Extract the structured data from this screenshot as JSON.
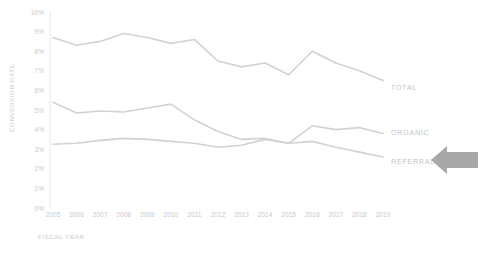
{
  "chart_data": {
    "type": "line",
    "title": "",
    "xlabel": "FISCAL YEAR",
    "ylabel": "CONVERSION RATE",
    "x": [
      2005,
      2006,
      2007,
      2008,
      2009,
      2010,
      2011,
      2012,
      2013,
      2014,
      2015,
      2016,
      2017,
      2018,
      2019
    ],
    "categories": [
      "2005",
      "2006",
      "2007",
      "2008",
      "2009",
      "2010",
      "2011",
      "2012",
      "2013",
      "2014",
      "2015",
      "2016",
      "2017",
      "2018",
      "2019"
    ],
    "ytick_labels": [
      "0%",
      "1%",
      "2%",
      "3%",
      "4%",
      "5%",
      "6%",
      "7%",
      "8%",
      "9%",
      "10%"
    ],
    "ytick_values": [
      0,
      1,
      2,
      3,
      4,
      5,
      6,
      7,
      8,
      9,
      10
    ],
    "ylim": [
      0,
      10
    ],
    "xlim": [
      2005,
      2019
    ],
    "grid": false,
    "legend_position": "right-inline",
    "units": "percent",
    "series": [
      {
        "name": "TOTAL",
        "label": "TOTAL",
        "color": "#d2d2d2",
        "values": [
          8.7,
          8.3,
          8.5,
          8.9,
          8.7,
          8.4,
          8.6,
          7.5,
          7.2,
          7.4,
          6.8,
          8.0,
          7.4,
          7.0,
          6.5
        ]
      },
      {
        "name": "ORGANIC",
        "label": "ORGANIC",
        "color": "#d2d2d2",
        "values": [
          5.4,
          4.85,
          4.95,
          4.9,
          5.1,
          5.3,
          4.5,
          3.9,
          3.5,
          3.55,
          3.3,
          4.2,
          4.0,
          4.1,
          3.8
        ]
      },
      {
        "name": "REFERRAL",
        "label": "REFERRAL",
        "color": "#d2d2d2",
        "values": [
          3.25,
          3.3,
          3.45,
          3.55,
          3.5,
          3.4,
          3.3,
          3.1,
          3.2,
          3.5,
          3.3,
          3.4,
          3.1,
          2.85,
          2.6
        ]
      }
    ],
    "annotations": [
      {
        "name": "referral-callout-arrow",
        "kind": "arrow",
        "direction": "left",
        "color": "#a8a8a8",
        "targets": "REFERRAL"
      }
    ]
  }
}
